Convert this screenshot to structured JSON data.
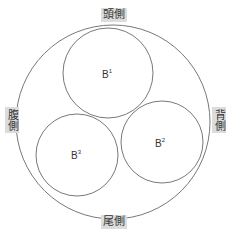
{
  "diagram": {
    "orientation_labels": {
      "top": "頭側",
      "bottom": "尾側",
      "left": "腹側",
      "right": "背側"
    },
    "circles": {
      "outer": {
        "cx": 113,
        "cy": 122,
        "r": 97
      },
      "b1": {
        "cx": 108,
        "cy": 73,
        "r": 45,
        "label_base": "B",
        "label_sup": "1"
      },
      "b2": {
        "cx": 162,
        "cy": 142,
        "r": 41,
        "label_base": "B",
        "label_sup": "2"
      },
      "b3": {
        "cx": 77,
        "cy": 155,
        "r": 41,
        "label_base": "B",
        "label_sup": "3"
      }
    },
    "colors": {
      "stroke": "#555555",
      "label_bg": "#dcdcdc",
      "text": "#333333"
    }
  }
}
